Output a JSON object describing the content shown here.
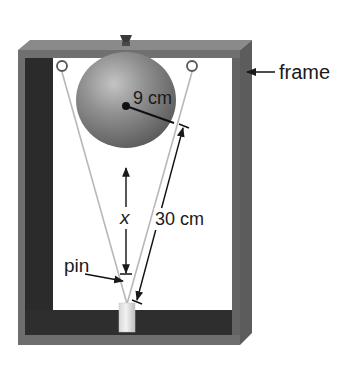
{
  "diagram": {
    "type": "physics-apparatus",
    "labels": {
      "frame": "frame",
      "radius": "9 cm",
      "string_length": "30 cm",
      "distance": "x",
      "pin": "pin"
    },
    "components": [
      {
        "name": "frame",
        "label": "frame"
      },
      {
        "name": "ball",
        "radius_label": "9 cm"
      },
      {
        "name": "string",
        "length_label": "30 cm"
      },
      {
        "name": "pin",
        "label": "pin"
      },
      {
        "name": "cylinder"
      },
      {
        "name": "rings",
        "count": 2
      }
    ],
    "colors": {
      "frame_face": "#6b6b6b",
      "frame_top": "#7d7d7d",
      "frame_inner_dark": "#2a2a2a",
      "ball": "#8a8a8a",
      "string": "#b5b5b5",
      "dimension_line": "#1a1a1a",
      "background": "#ffffff"
    }
  }
}
